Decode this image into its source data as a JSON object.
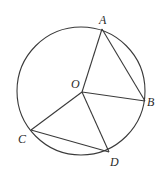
{
  "diagram": {
    "type": "geometry-circle",
    "stroke_color": "#3a3a3a",
    "circle": {
      "center_label": "O",
      "cx": 81,
      "cy": 91,
      "r": 64
    },
    "points": [
      {
        "label": "A",
        "x": 102,
        "y": 29
      },
      {
        "label": "B",
        "x": 145,
        "y": 101
      },
      {
        "label": "O",
        "x": 82,
        "y": 92
      },
      {
        "label": "C",
        "x": 31,
        "y": 130
      },
      {
        "label": "D",
        "x": 109,
        "y": 152
      }
    ],
    "segments": [
      "OA",
      "AB",
      "OB",
      "OC",
      "OD",
      "CD"
    ],
    "labels": {
      "A": "A",
      "B": "B",
      "O": "O",
      "C": "C",
      "D": "D"
    }
  }
}
